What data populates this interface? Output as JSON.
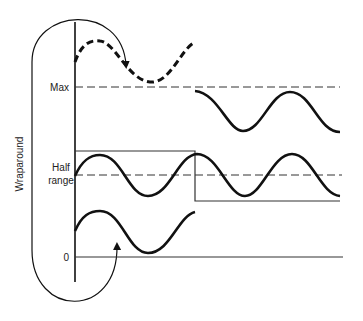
{
  "diagram": {
    "labels": {
      "max": "Max",
      "half_range_line1": "Half",
      "half_range_line2": "range",
      "zero": "0",
      "wraparound": "Wraparound"
    },
    "levels": {
      "max_y": 87,
      "half_range_y": 175,
      "zero_y": 257
    },
    "elements": [
      {
        "id": "vertical-axis",
        "type": "line",
        "desc": "vertical axis"
      },
      {
        "id": "max-line",
        "type": "dashed-line",
        "label": "Max"
      },
      {
        "id": "half-range-line",
        "type": "dashed-line",
        "label": "Half range"
      },
      {
        "id": "zero-line",
        "type": "solid-line",
        "label": "0"
      },
      {
        "id": "square-wave",
        "type": "step",
        "desc": "high from axis to ~x=195, then drops low"
      },
      {
        "id": "dashed-overflow-sine",
        "type": "dashed-sinusoid",
        "desc": "signal exceeding Max (before wrap)"
      },
      {
        "id": "wrapped-sine",
        "type": "sinusoid",
        "desc": "signal wrapped to near 0"
      },
      {
        "id": "middle-sine",
        "type": "sinusoid",
        "desc": "signal around half range"
      },
      {
        "id": "upper-right-sine",
        "type": "sinusoid",
        "desc": "signal just below Max after step"
      },
      {
        "id": "wraparound-loop",
        "type": "arrow-loop",
        "desc": "arrow from above Max wrapping back to bottom near 0"
      }
    ]
  },
  "colors": {
    "ink": "#111111",
    "background": "#ffffff"
  }
}
